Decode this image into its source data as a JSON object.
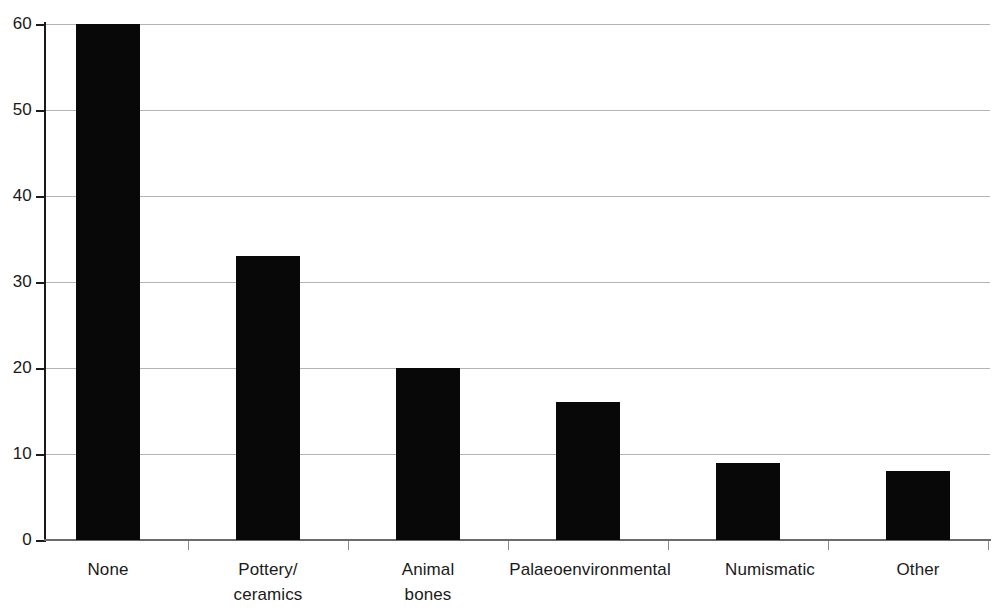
{
  "chart_data": {
    "type": "bar",
    "title": "",
    "subtitle": "",
    "xlabel": "",
    "ylabel": "",
    "categories": [
      "None",
      "Pottery/ceramics",
      "Animal bones",
      "Palaeoenvironmental",
      "Numismatic",
      "Other"
    ],
    "category_lines": [
      [
        "None"
      ],
      [
        "Pottery/",
        "ceramics"
      ],
      [
        "Animal",
        "bones"
      ],
      [
        "Palaeoenvironmental"
      ],
      [
        "Numismatic"
      ],
      [
        "Other"
      ]
    ],
    "values": [
      60,
      33,
      20,
      16,
      9,
      8
    ],
    "ylim": [
      0,
      60
    ],
    "yticks": [
      0,
      10,
      20,
      30,
      40,
      50,
      60
    ],
    "ytick_labels": [
      "0",
      "10",
      "20",
      "30",
      "40",
      "50",
      "60"
    ],
    "grid": true,
    "grid_axis": "y",
    "legend": false,
    "legend_position": "none",
    "bar_color": "#080808",
    "grid_color": "#b4b4b4",
    "axis_color": "#1a1a1a",
    "background_color": "#ffffff"
  },
  "layout": {
    "bar_left_px": [
      76,
      236,
      396,
      556,
      716,
      886
    ],
    "bar_width_px": [
      64,
      64,
      64,
      64,
      64,
      64
    ],
    "category_center_px": [
      108,
      268,
      428,
      590,
      770,
      918
    ],
    "x_tick_px": [
      188,
      348,
      508,
      668,
      828,
      988
    ]
  }
}
